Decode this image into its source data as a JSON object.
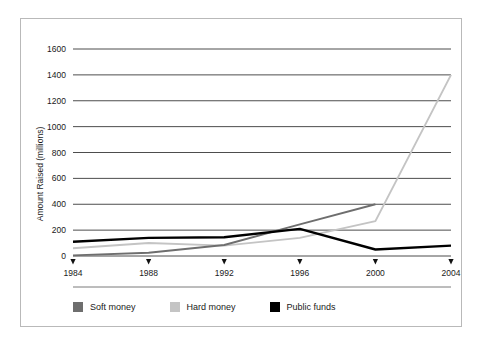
{
  "chart_data": {
    "type": "line",
    "title": "",
    "xlabel": "",
    "ylabel": "Amount Raised (millions)",
    "x": [
      1984,
      1988,
      1992,
      1996,
      2000,
      2004
    ],
    "xticklabels": [
      "1984",
      "1988",
      "1992",
      "1996",
      "2000",
      "2004"
    ],
    "yticks": [
      0,
      200,
      400,
      600,
      800,
      1000,
      1200,
      1400,
      1600
    ],
    "yticklabels": [
      "0",
      "200",
      "400",
      "600",
      "800",
      "1000",
      "1200",
      "1400",
      "1600"
    ],
    "ylim": [
      0,
      1600
    ],
    "xlim": [
      1984,
      2004
    ],
    "grid": "horizontal",
    "legend_position": "bottom-left",
    "series": [
      {
        "name": "Soft money",
        "color": "#6e6e6e",
        "x": [
          1984,
          1988,
          1992,
          1996,
          2000
        ],
        "values": [
          5,
          25,
          85,
          245,
          400
        ]
      },
      {
        "name": "Hard money",
        "color": "#c4c4c4",
        "x": [
          1984,
          1988,
          1992,
          1996,
          2000,
          2004
        ],
        "values": [
          60,
          100,
          80,
          140,
          270,
          1400
        ]
      },
      {
        "name": "Public funds",
        "color": "#000000",
        "x": [
          1984,
          1988,
          1992,
          1996,
          2000,
          2004
        ],
        "values": [
          110,
          140,
          145,
          210,
          50,
          80
        ]
      }
    ]
  },
  "legend": {
    "items": [
      {
        "label": "Soft money",
        "color": "#6e6e6e"
      },
      {
        "label": "Hard money",
        "color": "#c4c4c4"
      },
      {
        "label": "Public funds",
        "color": "#000000"
      }
    ]
  },
  "style": {
    "grid_color": "#4d4d4d",
    "border_color": "#b9b9b9",
    "separator_color": "#7a7a7a",
    "background": "#ffffff",
    "text_color": "#1a1a1a"
  }
}
